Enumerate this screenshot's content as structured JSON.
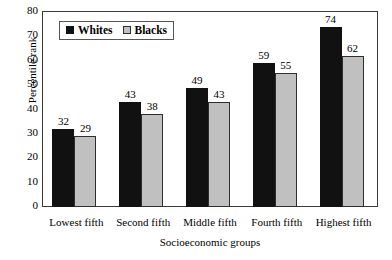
{
  "chart_data": {
    "type": "bar",
    "title": "",
    "subtitle": "",
    "xlabel": "Socioeconomic groups",
    "ylabel": "Percentile rank",
    "categories": [
      "Lowest fifth",
      "Second fifth",
      "Middle fifth",
      "Fourth fifth",
      "Highest fifth"
    ],
    "series": [
      {
        "name": "Whites",
        "color": "#111111",
        "values": [
          32,
          43,
          49,
          59,
          74
        ]
      },
      {
        "name": "Blacks",
        "color": "#c0c0c0",
        "values": [
          29,
          38,
          43,
          55,
          62
        ]
      }
    ],
    "ylim": [
      0,
      80
    ],
    "ytick_step": 10,
    "yticks": [
      80,
      70,
      60,
      50,
      40,
      30,
      20,
      10,
      0
    ],
    "grid": false,
    "legend_position": "top-left-inside",
    "data_labels": true
  },
  "legend": {
    "items": [
      {
        "label": "Whites",
        "swatch": "black-square-swatch"
      },
      {
        "label": "Blacks",
        "swatch": "gray-square-swatch"
      }
    ]
  },
  "axes": {
    "y_title": "Percentile rank",
    "x_title": "Socioeconomic groups"
  }
}
